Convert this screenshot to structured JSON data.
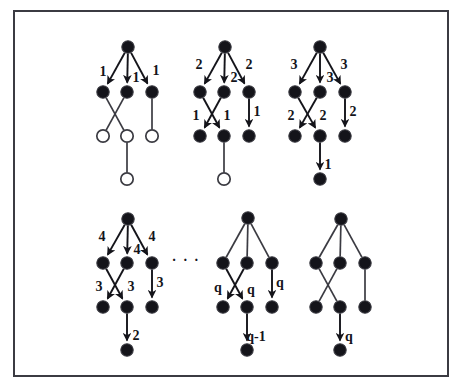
{
  "figure": {
    "title": "",
    "node_radius": 6.2,
    "colors": {
      "node_fill": "#14141a",
      "node_open_fill": "#ffffff",
      "node_stroke": "#3b3b42",
      "edge": "#3b3b42",
      "arrow": "#14141a",
      "frame": "#3b3b42",
      "background": "#ffffff"
    },
    "ellipsis": {
      "text": "· · ·",
      "x": 186,
      "y": 262
    },
    "graphs": [
      {
        "id": "graph-1",
        "nodes": [
          {
            "id": "r",
            "x": 128,
            "y": 47,
            "filled": true
          },
          {
            "id": "a1",
            "x": 103,
            "y": 92,
            "filled": true
          },
          {
            "id": "a2",
            "x": 127,
            "y": 92,
            "filled": true
          },
          {
            "id": "a3",
            "x": 152,
            "y": 92,
            "filled": true
          },
          {
            "id": "b1",
            "x": 103,
            "y": 136,
            "filled": false
          },
          {
            "id": "b2",
            "x": 127,
            "y": 136,
            "filled": false
          },
          {
            "id": "b3",
            "x": 152,
            "y": 136,
            "filled": false
          },
          {
            "id": "c1",
            "x": 127,
            "y": 179,
            "filled": false
          }
        ],
        "edges": [
          {
            "from": "r",
            "to": "a1",
            "arrow": true,
            "label": "1",
            "lx": 103,
            "ly": 73
          },
          {
            "from": "r",
            "to": "a2",
            "arrow": true,
            "label": "1",
            "lx": 136,
            "ly": 79
          },
          {
            "from": "r",
            "to": "a3",
            "arrow": true,
            "label": "1",
            "lx": 156,
            "ly": 72
          },
          {
            "from": "a1",
            "to": "b2",
            "arrow": false,
            "label": "",
            "lx": 0,
            "ly": 0
          },
          {
            "from": "a2",
            "to": "b1",
            "arrow": false,
            "label": "",
            "lx": 0,
            "ly": 0
          },
          {
            "from": "a3",
            "to": "b3",
            "arrow": false,
            "label": "",
            "lx": 0,
            "ly": 0
          },
          {
            "from": "b2",
            "to": "c1",
            "arrow": false,
            "label": "",
            "lx": 0,
            "ly": 0
          }
        ]
      },
      {
        "id": "graph-2",
        "nodes": [
          {
            "id": "r",
            "x": 225,
            "y": 47,
            "filled": true
          },
          {
            "id": "a1",
            "x": 200,
            "y": 92,
            "filled": true
          },
          {
            "id": "a2",
            "x": 224,
            "y": 92,
            "filled": true
          },
          {
            "id": "a3",
            "x": 249,
            "y": 92,
            "filled": true
          },
          {
            "id": "b1",
            "x": 200,
            "y": 136,
            "filled": true
          },
          {
            "id": "b2",
            "x": 224,
            "y": 136,
            "filled": true
          },
          {
            "id": "b3",
            "x": 249,
            "y": 136,
            "filled": true
          },
          {
            "id": "c1",
            "x": 224,
            "y": 179,
            "filled": false
          }
        ],
        "edges": [
          {
            "from": "r",
            "to": "a1",
            "arrow": true,
            "label": "2",
            "lx": 199,
            "ly": 66
          },
          {
            "from": "r",
            "to": "a2",
            "arrow": true,
            "label": "2",
            "lx": 234,
            "ly": 79
          },
          {
            "from": "r",
            "to": "a3",
            "arrow": true,
            "label": "2",
            "lx": 249,
            "ly": 66
          },
          {
            "from": "a1",
            "to": "b2",
            "arrow": true,
            "label": "1",
            "lx": 196,
            "ly": 117
          },
          {
            "from": "a2",
            "to": "b1",
            "arrow": true,
            "label": "1",
            "lx": 227,
            "ly": 117
          },
          {
            "from": "a3",
            "to": "b3",
            "arrow": true,
            "label": "1",
            "lx": 257,
            "ly": 113
          },
          {
            "from": "b2",
            "to": "c1",
            "arrow": false,
            "label": "",
            "lx": 0,
            "ly": 0
          }
        ]
      },
      {
        "id": "graph-3",
        "nodes": [
          {
            "id": "r",
            "x": 320,
            "y": 47,
            "filled": true
          },
          {
            "id": "a1",
            "x": 295,
            "y": 92,
            "filled": true
          },
          {
            "id": "a2",
            "x": 320,
            "y": 92,
            "filled": true
          },
          {
            "id": "a3",
            "x": 345,
            "y": 92,
            "filled": true
          },
          {
            "id": "b1",
            "x": 295,
            "y": 136,
            "filled": true
          },
          {
            "id": "b2",
            "x": 320,
            "y": 136,
            "filled": true
          },
          {
            "id": "b3",
            "x": 345,
            "y": 136,
            "filled": true
          },
          {
            "id": "c1",
            "x": 320,
            "y": 179,
            "filled": true
          }
        ],
        "edges": [
          {
            "from": "r",
            "to": "a1",
            "arrow": true,
            "label": "3",
            "lx": 294,
            "ly": 66
          },
          {
            "from": "r",
            "to": "a2",
            "arrow": true,
            "label": "3",
            "lx": 330,
            "ly": 79
          },
          {
            "from": "r",
            "to": "a3",
            "arrow": true,
            "label": "3",
            "lx": 344,
            "ly": 66
          },
          {
            "from": "a1",
            "to": "b2",
            "arrow": true,
            "label": "2",
            "lx": 291,
            "ly": 117
          },
          {
            "from": "a2",
            "to": "b1",
            "arrow": true,
            "label": "2",
            "lx": 323,
            "ly": 117
          },
          {
            "from": "a3",
            "to": "b3",
            "arrow": true,
            "label": "2",
            "lx": 353,
            "ly": 113
          },
          {
            "from": "b2",
            "to": "c1",
            "arrow": true,
            "label": "1",
            "lx": 328,
            "ly": 166
          }
        ]
      },
      {
        "id": "graph-4",
        "nodes": [
          {
            "id": "r",
            "x": 128,
            "y": 219,
            "filled": true
          },
          {
            "id": "a1",
            "x": 103,
            "y": 263,
            "filled": true
          },
          {
            "id": "a2",
            "x": 127,
            "y": 263,
            "filled": true
          },
          {
            "id": "a3",
            "x": 152,
            "y": 263,
            "filled": true
          },
          {
            "id": "b1",
            "x": 103,
            "y": 307,
            "filled": true
          },
          {
            "id": "b2",
            "x": 127,
            "y": 307,
            "filled": true
          },
          {
            "id": "b3",
            "x": 152,
            "y": 307,
            "filled": true
          },
          {
            "id": "c1",
            "x": 127,
            "y": 350,
            "filled": true
          }
        ],
        "edges": [
          {
            "from": "r",
            "to": "a1",
            "arrow": true,
            "label": "4",
            "lx": 102,
            "ly": 238
          },
          {
            "from": "r",
            "to": "a2",
            "arrow": true,
            "label": "4",
            "lx": 137,
            "ly": 251
          },
          {
            "from": "r",
            "to": "a3",
            "arrow": true,
            "label": "4",
            "lx": 152,
            "ly": 238
          },
          {
            "from": "a1",
            "to": "b2",
            "arrow": true,
            "label": "3",
            "lx": 99,
            "ly": 288
          },
          {
            "from": "a2",
            "to": "b1",
            "arrow": true,
            "label": "3",
            "lx": 131,
            "ly": 288
          },
          {
            "from": "a3",
            "to": "b3",
            "arrow": true,
            "label": "3",
            "lx": 160,
            "ly": 284
          },
          {
            "from": "b2",
            "to": "c1",
            "arrow": true,
            "label": "2",
            "lx": 136,
            "ly": 337
          }
        ]
      },
      {
        "id": "graph-5",
        "nodes": [
          {
            "id": "r",
            "x": 248,
            "y": 218,
            "filled": true
          },
          {
            "id": "a1",
            "x": 223,
            "y": 263,
            "filled": true
          },
          {
            "id": "a2",
            "x": 247,
            "y": 263,
            "filled": true
          },
          {
            "id": "a3",
            "x": 272,
            "y": 263,
            "filled": true
          },
          {
            "id": "b1",
            "x": 223,
            "y": 307,
            "filled": true
          },
          {
            "id": "b2",
            "x": 247,
            "y": 307,
            "filled": true
          },
          {
            "id": "b3",
            "x": 272,
            "y": 307,
            "filled": true
          },
          {
            "id": "c1",
            "x": 247,
            "y": 350,
            "filled": true
          }
        ],
        "edges": [
          {
            "from": "r",
            "to": "a1",
            "arrow": false,
            "label": "",
            "lx": 0,
            "ly": 0
          },
          {
            "from": "r",
            "to": "a2",
            "arrow": false,
            "label": "",
            "lx": 0,
            "ly": 0
          },
          {
            "from": "r",
            "to": "a3",
            "arrow": false,
            "label": "",
            "lx": 0,
            "ly": 0
          },
          {
            "from": "a1",
            "to": "b2",
            "arrow": true,
            "label": "q",
            "lx": 218,
            "ly": 289
          },
          {
            "from": "a2",
            "to": "b1",
            "arrow": true,
            "label": "q",
            "lx": 251,
            "ly": 291
          },
          {
            "from": "a3",
            "to": "b3",
            "arrow": true,
            "label": "q",
            "lx": 280,
            "ly": 284
          },
          {
            "from": "b2",
            "to": "c1",
            "arrow": true,
            "label": "q-1",
            "lx": 256,
            "ly": 338
          }
        ]
      },
      {
        "id": "graph-6",
        "nodes": [
          {
            "id": "r",
            "x": 341,
            "y": 219,
            "filled": true
          },
          {
            "id": "a1",
            "x": 316,
            "y": 263,
            "filled": true
          },
          {
            "id": "a2",
            "x": 340,
            "y": 263,
            "filled": true
          },
          {
            "id": "a3",
            "x": 365,
            "y": 263,
            "filled": true
          },
          {
            "id": "b1",
            "x": 316,
            "y": 307,
            "filled": true
          },
          {
            "id": "b2",
            "x": 340,
            "y": 307,
            "filled": true
          },
          {
            "id": "b3",
            "x": 365,
            "y": 307,
            "filled": true
          },
          {
            "id": "c1",
            "x": 340,
            "y": 350,
            "filled": true
          }
        ],
        "edges": [
          {
            "from": "r",
            "to": "a1",
            "arrow": false,
            "label": "",
            "lx": 0,
            "ly": 0
          },
          {
            "from": "r",
            "to": "a2",
            "arrow": false,
            "label": "",
            "lx": 0,
            "ly": 0
          },
          {
            "from": "r",
            "to": "a3",
            "arrow": false,
            "label": "",
            "lx": 0,
            "ly": 0
          },
          {
            "from": "a1",
            "to": "b2",
            "arrow": false,
            "label": "",
            "lx": 0,
            "ly": 0
          },
          {
            "from": "a2",
            "to": "b1",
            "arrow": false,
            "label": "",
            "lx": 0,
            "ly": 0
          },
          {
            "from": "a3",
            "to": "b3",
            "arrow": false,
            "label": "",
            "lx": 0,
            "ly": 0
          },
          {
            "from": "b2",
            "to": "c1",
            "arrow": true,
            "label": "q",
            "lx": 349,
            "ly": 338
          }
        ]
      }
    ]
  }
}
